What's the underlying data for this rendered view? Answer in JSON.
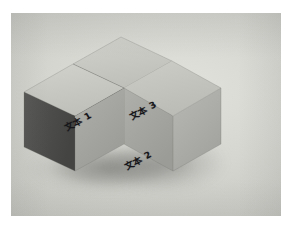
{
  "scene": {
    "kind": "photograph",
    "subject": "three gray isometric cubes arranged in an L / T configuration",
    "background_color": "#d6d6d1",
    "frame_color": "#ffffff"
  },
  "cubes": [
    {
      "id": "cube-left",
      "label": "文本 1",
      "position": "front-left",
      "top_face_color": "#c8c8c3",
      "left_face_color": "#4d4d4d",
      "right_face_color": "#a4a4a0"
    },
    {
      "id": "cube-front-right",
      "label": "文本 2",
      "position": "front-right",
      "top_face_color": "#c8c8c3",
      "left_face_color": "#4d4d4d",
      "right_face_color": "#a4a4a0"
    },
    {
      "id": "cube-top",
      "label": "文本 3",
      "position": "back-top",
      "top_face_color": "#c8c8c3",
      "left_face_color": "#4d4d4d",
      "right_face_color": "#a4a4a0"
    }
  ],
  "labels": {
    "one": "文本 1",
    "two": "文本 2",
    "three": "文本 3"
  }
}
